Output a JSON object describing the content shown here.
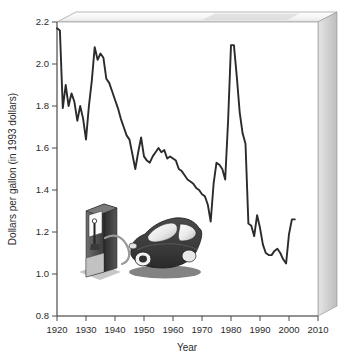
{
  "chart_data": {
    "type": "line",
    "title": "",
    "xlabel": "Year",
    "ylabel": "Dollars per gallon (in 1993 dollars)",
    "xlim": [
      1920,
      2010
    ],
    "ylim": [
      0.8,
      2.2
    ],
    "xticks": [
      1920,
      1930,
      1940,
      1950,
      1960,
      1970,
      1980,
      1990,
      2000,
      2010
    ],
    "yticks": [
      "0.8",
      "1.0",
      "1.2",
      "1.4",
      "1.6",
      "1.8",
      "2.0",
      "2.2"
    ],
    "grid": false,
    "legend": "none",
    "series": [
      {
        "name": "Gasoline price",
        "color": "#2b2b2b",
        "x": [
          1920,
          1921,
          1922,
          1923,
          1924,
          1925,
          1926,
          1927,
          1928,
          1929,
          1930,
          1931,
          1932,
          1933,
          1934,
          1935,
          1936,
          1937,
          1938,
          1939,
          1940,
          1941,
          1942,
          1943,
          1944,
          1945,
          1946,
          1947,
          1948,
          1949,
          1950,
          1951,
          1952,
          1953,
          1954,
          1955,
          1956,
          1957,
          1958,
          1959,
          1960,
          1961,
          1962,
          1963,
          1964,
          1965,
          1966,
          1967,
          1968,
          1969,
          1970,
          1971,
          1972,
          1973,
          1974,
          1975,
          1976,
          1977,
          1978,
          1979,
          1980,
          1981,
          1982,
          1983,
          1984,
          1985,
          1986,
          1987,
          1988,
          1989,
          1990,
          1991,
          1992,
          1993,
          1994,
          1995,
          1996,
          1997,
          1998,
          1999,
          2000,
          2001,
          2002
        ],
        "values": [
          2.17,
          2.16,
          1.79,
          1.9,
          1.8,
          1.86,
          1.82,
          1.73,
          1.8,
          1.74,
          1.64,
          1.8,
          1.92,
          2.08,
          2.02,
          2.05,
          2.03,
          1.93,
          1.91,
          1.87,
          1.83,
          1.79,
          1.74,
          1.7,
          1.66,
          1.64,
          1.57,
          1.5,
          1.58,
          1.65,
          1.56,
          1.54,
          1.53,
          1.56,
          1.58,
          1.6,
          1.58,
          1.59,
          1.55,
          1.56,
          1.55,
          1.54,
          1.5,
          1.49,
          1.47,
          1.45,
          1.44,
          1.43,
          1.41,
          1.4,
          1.38,
          1.37,
          1.33,
          1.25,
          1.43,
          1.53,
          1.52,
          1.5,
          1.45,
          1.73,
          2.09,
          2.09,
          1.94,
          1.77,
          1.67,
          1.62,
          1.24,
          1.23,
          1.18,
          1.28,
          1.22,
          1.14,
          1.1,
          1.09,
          1.09,
          1.11,
          1.12,
          1.1,
          1.07,
          1.05,
          1.19,
          1.26,
          1.26
        ]
      }
    ],
    "annotations": [
      {
        "name": "gas-pump-illustration",
        "label": "gas pump"
      },
      {
        "name": "car-illustration",
        "label": "car"
      }
    ],
    "colors": {
      "line": "#2b2b2b",
      "axis": "#4a4a4a",
      "panel_top": "#f0f0f0",
      "panel_side": "#c9c9c9",
      "plot_bg": "#ffffff",
      "car_body": "#3b3b3b",
      "pump_dark": "#2e2e2e",
      "pump_light": "#d8d8d8"
    }
  }
}
